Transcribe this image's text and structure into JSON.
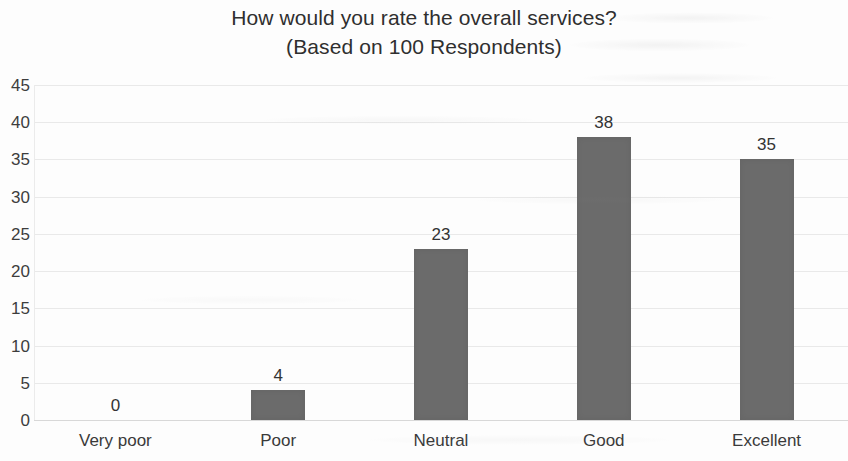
{
  "chart_data": {
    "type": "bar",
    "title": "How would you rate the overall services?",
    "subtitle": "(Based on 100 Respondents)",
    "categories": [
      "Very poor",
      "Poor",
      "Neutral",
      "Good",
      "Excellent"
    ],
    "values": [
      0,
      4,
      23,
      38,
      35
    ],
    "data_labels": [
      "0",
      "4",
      "23",
      "38",
      "35"
    ],
    "xlabel": "",
    "ylabel": "",
    "ylim": [
      0,
      45
    ],
    "ytick_step": 5,
    "yticks": [
      45,
      40,
      35,
      30,
      25,
      20,
      15,
      10,
      5,
      0
    ],
    "ytick_labels": [
      "45",
      "40",
      "35",
      "30",
      "25",
      "20",
      "15",
      "10",
      "5",
      "0"
    ],
    "grid": true,
    "grid_axis": "y",
    "legend": false,
    "legend_position": "none",
    "bar_color": "#6b6b6b",
    "background_color": "#fdfdfd",
    "gridline_color": "#e9e9e9",
    "text_color": "#3a3a3a"
  }
}
